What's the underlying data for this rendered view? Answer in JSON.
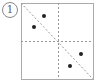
{
  "figure": {
    "label": "1",
    "box": {
      "x": 21,
      "y": 3,
      "w": 72,
      "h": 76,
      "stroke": "#aaaaaa"
    },
    "guides": {
      "vertical_x": 58,
      "horizontal_y": 41,
      "color": "#999999"
    },
    "diagonal": {
      "x1": 21,
      "y1": 3,
      "x2": 93,
      "y2": 79,
      "color": "#999999"
    },
    "points": [
      {
        "x": 44,
        "y": 16
      },
      {
        "x": 34,
        "y": 27
      },
      {
        "x": 81,
        "y": 54
      },
      {
        "x": 70,
        "y": 66
      }
    ],
    "point_color": "#222222"
  }
}
